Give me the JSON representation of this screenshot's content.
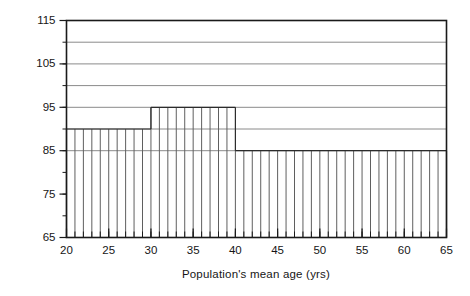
{
  "chart_data": {
    "type": "bar",
    "title": "",
    "xlabel": "Population's mean age (yrs)",
    "ylabel": "TWA (dB)",
    "xlim": [
      20,
      65
    ],
    "ylim": [
      65,
      115
    ],
    "grid": true,
    "legend": null,
    "x_major_ticks": [
      20,
      25,
      30,
      35,
      40,
      45,
      50,
      55,
      60,
      65
    ],
    "x_minor_tick_step": 1,
    "y_major_ticks": [
      65,
      75,
      85,
      95,
      105,
      115
    ],
    "y_minor_tick_step": 5,
    "gridlines_y": [
      85,
      90,
      95,
      100,
      105,
      110
    ],
    "bar_baseline": 65,
    "bar_width_years": 1,
    "steps": [
      {
        "x_start": 20,
        "x_end": 30,
        "value": 90
      },
      {
        "x_start": 30,
        "x_end": 40,
        "value": 95
      },
      {
        "x_start": 40,
        "x_end": 65,
        "value": 85
      }
    ],
    "categories": [
      20,
      21,
      22,
      23,
      24,
      25,
      26,
      27,
      28,
      29,
      30,
      31,
      32,
      33,
      34,
      35,
      36,
      37,
      38,
      39,
      40,
      41,
      42,
      43,
      44,
      45,
      46,
      47,
      48,
      49,
      50,
      51,
      52,
      53,
      54,
      55,
      56,
      57,
      58,
      59,
      60,
      61,
      62,
      63,
      64
    ],
    "values": [
      90,
      90,
      90,
      90,
      90,
      90,
      90,
      90,
      90,
      90,
      95,
      95,
      95,
      95,
      95,
      95,
      95,
      95,
      95,
      95,
      85,
      85,
      85,
      85,
      85,
      85,
      85,
      85,
      85,
      85,
      85,
      85,
      85,
      85,
      85,
      85,
      85,
      85,
      85,
      85,
      85,
      85,
      85,
      85,
      85
    ]
  },
  "axis": {
    "y_tick_labels": [
      "115",
      "105",
      "95",
      "85",
      "75",
      "65"
    ],
    "x_tick_labels": [
      "20",
      "25",
      "30",
      "35",
      "40",
      "45",
      "50",
      "55",
      "60",
      "65"
    ],
    "y_title": "TWA (dB)",
    "x_title": "Population's mean age (yrs)"
  },
  "colors": {
    "frame": "#1a1a1a",
    "gridline": "#8a8a8a",
    "bar_line": "#5f5f5f",
    "step_top": "#2b2b2b",
    "background": "#ffffff",
    "text": "#161616"
  }
}
